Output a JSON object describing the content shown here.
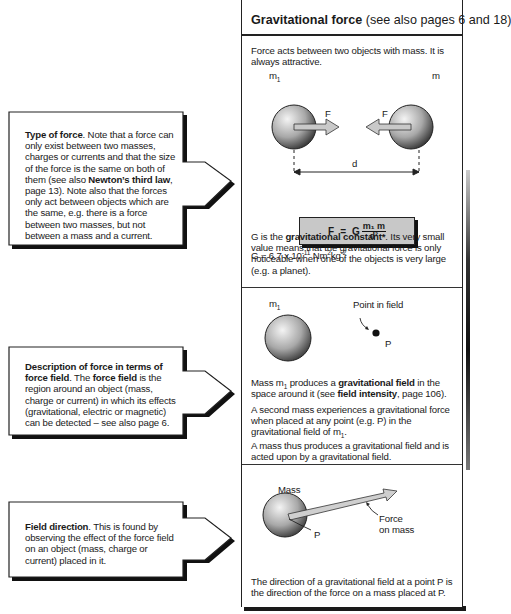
{
  "panel": {
    "header": {
      "title": "Gravitational force",
      "subtitle": " (see also pages 6 and 18)"
    },
    "section1": {
      "intro": "Force acts between two objects with mass. It is always attractive.",
      "diagram": {
        "mass1_label": "m",
        "mass1_subscript": "1",
        "mass2_label": "m",
        "force_label_left": "F",
        "force_label_right": "F",
        "distance_label": "d"
      },
      "formula": {
        "lhs": "F",
        "equals": "=",
        "constant": "G",
        "numerator": "m₁ m",
        "denominator": "d²"
      },
      "g_value": {
        "prefix": "G = 6.7 x 10",
        "exp1": "-11",
        "unit_a": " Nm",
        "exp2": "2",
        "unit_b": "kg",
        "exp3": "-2"
      },
      "description": {
        "pre": "G is the ",
        "bold": "gravitational constant*",
        "post": ". Its very small value means that the gravitational force is only noticeable when one of the objects is very large (e.g. a planet)."
      }
    },
    "section2": {
      "diagram": {
        "mass_label": "m",
        "mass_subscript": "1",
        "point_caption": "Point in field",
        "point_label": "P"
      },
      "para1": {
        "a": "Mass m",
        "sub": "1",
        "b": " produces a ",
        "bold1": "gravitational field",
        "c": " in the space around it (see ",
        "bold2": "field intensity",
        "d": ", page 106)."
      },
      "para2": {
        "a": "A second mass experiences a gravitational force when placed at any point (e.g. P) in the gravitational field of m",
        "sub": "1",
        "b": "."
      },
      "para3": "A mass thus produces a gravitational field and is acted upon by a gravitational field."
    },
    "section3": {
      "diagram": {
        "mass_label": "Mass",
        "point_label": "P",
        "force_caption_1": "Force",
        "force_caption_2": "on mass"
      },
      "text": "The direction of a gravitational field at a point P is the direction of the force on a mass placed at P."
    }
  },
  "callouts": [
    {
      "bold": "Type of force",
      "text_a": ". Note that a force can only exist between two masses, charges or currents and that the size of the force is the same on both of them (see also ",
      "bold2": "Newton’s third law",
      "text_b": ", page 13). Note also that the forces only act between objects which are the same, e.g. there is a force between two masses, but not between a mass and a current."
    },
    {
      "bold": "Description of force in terms of force field",
      "text_a": ". The ",
      "bold2": "force field",
      "text_b": " is the region around an object (mass, charge or current) in which its effects (gravitational, electric or magnetic) can be detected – see also page 6."
    },
    {
      "bold": "Field direction",
      "text_a": ". This is found by observing the effect of the force field on an object (mass, charge or current) placed in it.",
      "bold2": "",
      "text_b": ""
    }
  ],
  "colors": {
    "ink": "#1a1a1a",
    "formula_bg": "#c8c8c8",
    "sphere_light": "#f2f2f2",
    "sphere_dark": "#3a3a3a"
  }
}
